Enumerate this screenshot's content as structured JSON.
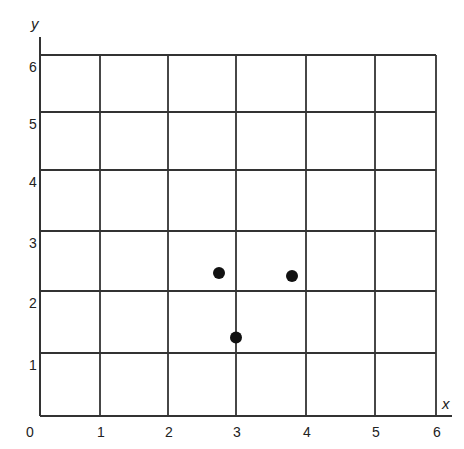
{
  "chart_data": {
    "type": "scatter",
    "title": "",
    "xlabel": "x",
    "ylabel": "y",
    "xlim": [
      0,
      6
    ],
    "ylim": [
      0,
      6
    ],
    "grid": true,
    "legend": null,
    "x_ticks": [
      "0",
      "1",
      "2",
      "3",
      "4",
      "5",
      "6"
    ],
    "y_ticks": [
      "1",
      "2",
      "3",
      "4",
      "5",
      "6"
    ],
    "series": [
      {
        "name": "points",
        "points": [
          {
            "x": 2.75,
            "y": 2.3
          },
          {
            "x": 3.8,
            "y": 2.25
          },
          {
            "x": 3.0,
            "y": 1.25
          }
        ]
      }
    ]
  },
  "layout": {
    "x_gridline_px": [
      40,
      100,
      168,
      236,
      306,
      375,
      436
    ],
    "y_gridline_px": [
      416,
      353,
      291,
      231,
      170,
      112,
      55
    ]
  }
}
